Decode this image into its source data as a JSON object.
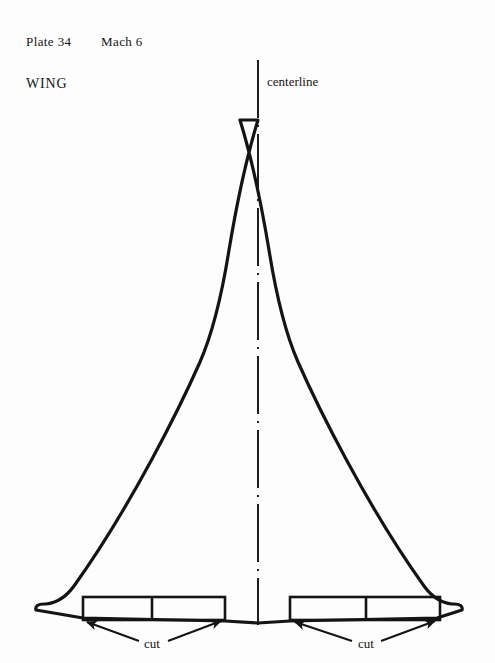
{
  "page": {
    "background_color": "#fdfdfd",
    "ink_color": "#141414",
    "width": 495,
    "height": 663
  },
  "header": {
    "plate": "Plate 34",
    "mach": "Mach 6",
    "part": "WING"
  },
  "annotations": {
    "centerline": "centerline",
    "cut_left": "cut",
    "cut_right": "cut"
  },
  "diagram": {
    "type": "wing-planform-template",
    "apex": {
      "x": 258,
      "y": 120
    },
    "centerline_x": 258,
    "centerline_top_y": 60,
    "centerline_bottom_y": 625,
    "wingtip_left_x": 40,
    "wingtip_right_x": 465,
    "trailing_edge_y": 617,
    "trailing_edge_center_y": 623,
    "outline_stroke_width": 3.2,
    "centerline_dash_pattern": "58 7 2 7",
    "rect_stroke_width": 2.6,
    "rectangles": [
      {
        "name": "cut-rect-left",
        "x": 83,
        "y": 597,
        "width": 142,
        "height": 23,
        "divider_x": 152
      },
      {
        "name": "cut-rect-right",
        "x": 290,
        "y": 597,
        "width": 150,
        "height": 23,
        "divider_x": 366
      }
    ],
    "arrows": [
      {
        "name": "cut-arrow-left-outer",
        "from": [
          139,
          641
        ],
        "to": [
          85,
          621
        ]
      },
      {
        "name": "cut-arrow-left-inner",
        "from": [
          168,
          641
        ],
        "to": [
          223,
          620
        ]
      },
      {
        "name": "cut-arrow-right-outer",
        "from": [
          352,
          641
        ],
        "to": [
          293,
          621
        ]
      },
      {
        "name": "cut-arrow-right-inner",
        "from": [
          381,
          641
        ],
        "to": [
          437,
          620
        ]
      }
    ]
  }
}
